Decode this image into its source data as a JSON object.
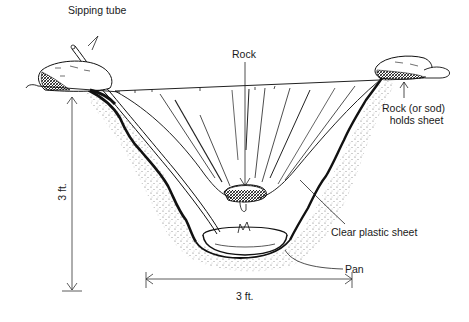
{
  "diagram": {
    "colors": {
      "ink": "#1a1a1a",
      "background": "#ffffff",
      "stipple": "#555555"
    },
    "labels": {
      "sipping_tube": "Sipping tube",
      "rock_center": "Rock",
      "rock_sod_line1": "Rock (or sod)",
      "rock_sod_line2": "holds sheet",
      "clear_plastic_sheet": "Clear plastic sheet",
      "pan": "Pan",
      "depth": "3 ft.",
      "width": "3 ft."
    },
    "dimensions": [
      {
        "name": "depth",
        "value": "3 ft.",
        "orientation": "vertical"
      },
      {
        "name": "width",
        "value": "3 ft.",
        "orientation": "horizontal"
      }
    ]
  }
}
